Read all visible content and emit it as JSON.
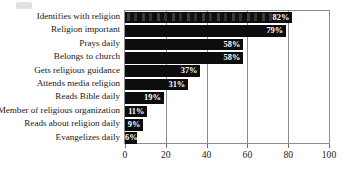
{
  "chart_data": {
    "type": "bar",
    "orientation": "horizontal",
    "title": "",
    "subtitle": "",
    "xlabel": "",
    "ylabel": "",
    "xlim": [
      0,
      100
    ],
    "xticks": [
      "0",
      "20",
      "40",
      "60",
      "80",
      "100"
    ],
    "xtick_values": [
      0,
      20,
      40,
      60,
      80,
      100
    ],
    "grid": true,
    "grid_axis": "x",
    "legend": null,
    "legend_position": "none",
    "bar_color": "#0d0d0d",
    "value_label_color": "#ffffff",
    "value_suffix": "%",
    "categories": [
      "Identifies with religion",
      "Religion important",
      "Prays daily",
      "Belongs to church",
      "Gets religious guidance",
      "Attends media religion",
      "Reads Bible daily",
      "Member of religious organization",
      "Reads about religion daily",
      "Evangelizes daily"
    ],
    "values": [
      82,
      79,
      58,
      58,
      37,
      31,
      19,
      11,
      9,
      6
    ],
    "value_labels": [
      "82%",
      "79%",
      "58%",
      "58%",
      "37%",
      "31%",
      "19%",
      "11%",
      "9%",
      "6%"
    ]
  }
}
